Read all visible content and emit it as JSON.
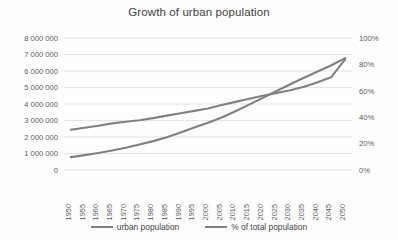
{
  "chart_data": {
    "type": "line",
    "title": "Growth of urban population",
    "xlabel": "",
    "ylabel": "",
    "grid": true,
    "legend_position": "bottom",
    "categories": [
      "1950",
      "1955",
      "1960",
      "1965",
      "1970",
      "1975",
      "1980",
      "1985",
      "1990",
      "1995",
      "2000",
      "2005",
      "2010",
      "2015",
      "2020",
      "2025",
      "2030",
      "2035",
      "2040",
      "2045",
      "2050"
    ],
    "axes": {
      "left": {
        "label": "",
        "min": 0,
        "max": 8000000,
        "step": 1000000,
        "ticks": [
          "0",
          "1 000 000",
          "2 000 000",
          "3 000 000",
          "4 000 000",
          "5 000 000",
          "6 000 000",
          "7 000 000",
          "8 000 000"
        ]
      },
      "right": {
        "label": "",
        "min": 0,
        "max": 100,
        "step": 20,
        "ticks": [
          "0%",
          "20%",
          "40%",
          "60%",
          "80%",
          "100%"
        ]
      }
    },
    "series": [
      {
        "name": "urban population",
        "axis": "left",
        "color": "#808080",
        "values": [
          780000,
          900000,
          1030000,
          1180000,
          1350000,
          1540000,
          1750000,
          1990000,
          2270000,
          2580000,
          2860000,
          3180000,
          3560000,
          3960000,
          4370000,
          4790000,
          5200000,
          5590000,
          5970000,
          6350000,
          6780000
        ]
      },
      {
        "name": "% of total population",
        "axis": "right",
        "color": "#808080",
        "values": [
          30.5,
          32.0,
          33.5,
          35.3,
          36.6,
          37.7,
          39.3,
          41.2,
          43.0,
          44.8,
          46.6,
          49.2,
          51.6,
          54.0,
          56.2,
          58.3,
          60.4,
          63.0,
          66.4,
          70.5,
          83.8
        ]
      }
    ]
  }
}
